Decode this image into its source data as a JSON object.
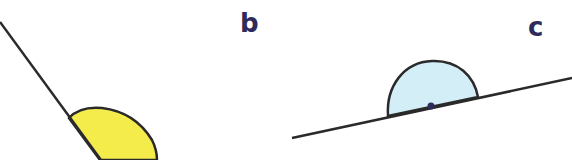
{
  "diagram": {
    "title": "",
    "colors": {
      "line": "#2a2a2a",
      "label": "#2e2a5c",
      "angle_a_fill": "#f3ec4b",
      "angle_c_fill": "#d4eef8",
      "vertex_dot": "#2e2a5c"
    },
    "labels": {
      "b": "b",
      "c": "c"
    },
    "angles": [
      {
        "id": "a-partial",
        "shape": "arc",
        "fill": "yellow",
        "description": "obtuse angle arc along a steep descending line (cropped)"
      },
      {
        "id": "c",
        "shape": "semicircle",
        "fill": "light-blue",
        "description": "straight angle (180°) on a slanted line with vertex dot"
      }
    ]
  }
}
